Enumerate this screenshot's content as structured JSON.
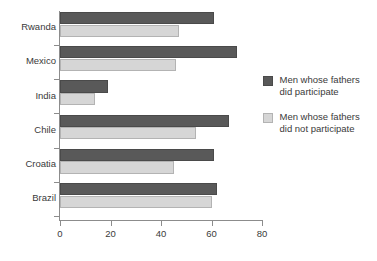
{
  "chart_data": {
    "type": "bar",
    "orientation": "horizontal",
    "title": "",
    "subtitle": "",
    "xlabel": "",
    "ylabel": "",
    "xlim": [
      0,
      80
    ],
    "ylim": null,
    "grid": false,
    "legend_position": "right",
    "categories": [
      "Rwanda",
      "Mexico",
      "India",
      "Chile",
      "Croatia",
      "Brazil"
    ],
    "xticks": [
      0,
      20,
      40,
      60,
      80
    ],
    "xtick_labels": [
      "0",
      "20",
      "40",
      "60",
      "80"
    ],
    "series": [
      {
        "name": "Men whose fathers\ndid participate",
        "color": "#595959",
        "values": [
          61,
          70,
          19,
          67,
          61,
          62
        ]
      },
      {
        "name": "Men whose fathers\ndid not participate",
        "color": "#d6d6d6",
        "values": [
          47,
          46,
          14,
          54,
          45,
          60
        ]
      }
    ]
  },
  "legend": {
    "entries": [
      {
        "label": "Men whose fathers\ndid participate",
        "color": "#595959"
      },
      {
        "label": "Men whose fathers\ndid not participate",
        "color": "#d6d6d6"
      }
    ]
  },
  "axis": {
    "x_tick_labels": [
      "0",
      "20",
      "40",
      "60",
      "80"
    ],
    "category_labels": [
      "Rwanda",
      "Mexico",
      "India",
      "Chile",
      "Croatia",
      "Brazil"
    ]
  },
  "colors": {
    "dark_bar": "#595959",
    "light_bar": "#d6d6d6",
    "axis": "#8c8c8c",
    "text": "#3a3a3a",
    "background": "#ffffff"
  }
}
